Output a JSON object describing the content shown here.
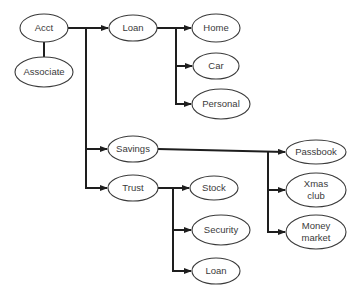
{
  "diagram": {
    "type": "hierarchy",
    "colors": {
      "line": "#1e1e1e",
      "node_stroke": "#3a3a3a",
      "text": "#3a3a3a",
      "background": "#ffffff"
    },
    "nodes": [
      {
        "id": "acct",
        "label": [
          "Acct"
        ],
        "cx": 44,
        "cy": 28,
        "rx": 24,
        "ry": 14
      },
      {
        "id": "associate",
        "label": [
          "Associate"
        ],
        "cx": 44,
        "cy": 72,
        "rx": 29,
        "ry": 15
      },
      {
        "id": "loan",
        "label": [
          "Loan"
        ],
        "cx": 133,
        "cy": 28,
        "rx": 24,
        "ry": 13
      },
      {
        "id": "home",
        "label": [
          "Home"
        ],
        "cx": 216,
        "cy": 28,
        "rx": 24,
        "ry": 14
      },
      {
        "id": "car",
        "label": [
          "Car"
        ],
        "cx": 216,
        "cy": 66,
        "rx": 23,
        "ry": 13
      },
      {
        "id": "personal",
        "label": [
          "Personal"
        ],
        "cx": 221,
        "cy": 104,
        "rx": 29,
        "ry": 15
      },
      {
        "id": "savings",
        "label": [
          "Savings"
        ],
        "cx": 133,
        "cy": 149,
        "rx": 25,
        "ry": 13
      },
      {
        "id": "trust",
        "label": [
          "Trust"
        ],
        "cx": 133,
        "cy": 188,
        "rx": 25,
        "ry": 13
      },
      {
        "id": "stock",
        "label": [
          "Stock"
        ],
        "cx": 214,
        "cy": 188,
        "rx": 24,
        "ry": 12
      },
      {
        "id": "security",
        "label": [
          "Security"
        ],
        "cx": 221,
        "cy": 230,
        "rx": 29,
        "ry": 15
      },
      {
        "id": "loan2",
        "label": [
          "Loan"
        ],
        "cx": 216,
        "cy": 271,
        "rx": 24,
        "ry": 13
      },
      {
        "id": "passbook",
        "label": [
          "Passbook"
        ],
        "cx": 316,
        "cy": 152,
        "rx": 30,
        "ry": 12
      },
      {
        "id": "xmas",
        "label": [
          "Xmas",
          "club"
        ],
        "cx": 316,
        "cy": 190,
        "rx": 30,
        "ry": 17
      },
      {
        "id": "money",
        "label": [
          "Money",
          "market"
        ],
        "cx": 316,
        "cy": 232,
        "rx": 30,
        "ry": 17
      }
    ],
    "edges": [
      {
        "from": "acct",
        "to": "associate",
        "arrow": false
      },
      {
        "from": "acct",
        "to": "loan",
        "arrow": true
      },
      {
        "from": "acct",
        "to": "savings",
        "arrow": true
      },
      {
        "from": "acct",
        "to": "trust",
        "arrow": true
      },
      {
        "from": "loan",
        "to": "home",
        "arrow": true
      },
      {
        "from": "loan",
        "to": "car",
        "arrow": true
      },
      {
        "from": "loan",
        "to": "personal",
        "arrow": true
      },
      {
        "from": "savings",
        "to": "passbook",
        "arrow": true
      },
      {
        "from": "savings",
        "to": "xmas",
        "arrow": true
      },
      {
        "from": "savings",
        "to": "money",
        "arrow": true
      },
      {
        "from": "trust",
        "to": "stock",
        "arrow": true
      },
      {
        "from": "trust",
        "to": "security",
        "arrow": true
      },
      {
        "from": "trust",
        "to": "loan2",
        "arrow": true
      }
    ],
    "connectors": [
      {
        "id": "acct-associate",
        "points": [
          [
            44,
            42
          ],
          [
            44,
            57
          ]
        ],
        "arrow": false
      },
      {
        "id": "acct-trunk",
        "points": [
          [
            68,
            28
          ],
          [
            109,
            28
          ]
        ],
        "arrow": true
      },
      {
        "id": "acct-trunk-vertical",
        "points": [
          [
            86,
            28
          ],
          [
            86,
            188
          ],
          [
            108,
            188
          ]
        ],
        "arrow": true
      },
      {
        "id": "acct-to-savings",
        "points": [
          [
            86,
            149
          ],
          [
            108,
            149
          ]
        ],
        "arrow": true
      },
      {
        "id": "loan-trunk",
        "points": [
          [
            157,
            28
          ],
          [
            192,
            28
          ]
        ],
        "arrow": true
      },
      {
        "id": "loan-trunk-vertical",
        "points": [
          [
            176,
            28
          ],
          [
            176,
            104
          ],
          [
            192,
            104
          ]
        ],
        "arrow": true
      },
      {
        "id": "loan-to-car",
        "points": [
          [
            176,
            66
          ],
          [
            193,
            66
          ]
        ],
        "arrow": true
      },
      {
        "id": "savings-trunk",
        "points": [
          [
            158,
            149
          ],
          [
            286,
            152
          ]
        ],
        "arrow": true
      },
      {
        "id": "savings-trunk-vertical",
        "points": [
          [
            268,
            151
          ],
          [
            268,
            232
          ],
          [
            286,
            232
          ]
        ],
        "arrow": true
      },
      {
        "id": "savings-to-xmas",
        "points": [
          [
            268,
            190
          ],
          [
            286,
            190
          ]
        ],
        "arrow": true
      },
      {
        "id": "trust-trunk",
        "points": [
          [
            158,
            188
          ],
          [
            190,
            188
          ]
        ],
        "arrow": true
      },
      {
        "id": "trust-trunk-vertical",
        "points": [
          [
            173,
            188
          ],
          [
            173,
            271
          ],
          [
            192,
            271
          ]
        ],
        "arrow": true
      },
      {
        "id": "trust-to-security",
        "points": [
          [
            173,
            230
          ],
          [
            192,
            230
          ]
        ],
        "arrow": true
      }
    ]
  },
  "labels": {
    "acct": "Acct",
    "associate": "Associate",
    "loan": "Loan",
    "home": "Home",
    "car": "Car",
    "personal": "Personal",
    "savings": "Savings",
    "trust": "Trust",
    "stock": "Stock",
    "security": "Security",
    "loan2": "Loan",
    "passbook": "Passbook",
    "xmas_line1": "Xmas",
    "xmas_line2": "club",
    "money_line1": "Money",
    "money_line2": "market"
  }
}
